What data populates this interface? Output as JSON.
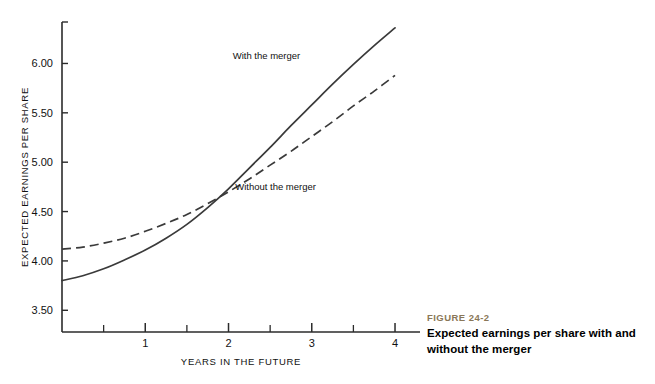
{
  "figure": {
    "kicker": "FIGURE 24-2",
    "title": "Expected earnings per share with and without the merger",
    "kicker_color": "#8a7758"
  },
  "chart_data": {
    "type": "line",
    "title": "Expected earnings per share with and without the merger",
    "xlabel": "YEARS IN THE FUTURE",
    "ylabel": "EXPECTED EARNINGS PER SHARE",
    "xlim": [
      0,
      4.3
    ],
    "ylim": [
      3.28,
      6.42
    ],
    "grid": false,
    "legend_position": "inline-annotations",
    "x_ticks_major": [
      1,
      2,
      3,
      4
    ],
    "x_tick_labels": [
      "1",
      "2",
      "3",
      "4"
    ],
    "x_ticks_minor": [
      0.5,
      1.5,
      2.5,
      3.5
    ],
    "y_ticks": [
      3.5,
      4.0,
      4.5,
      5.0,
      5.5,
      6.0
    ],
    "y_tick_labels": [
      "3.50",
      "4.00",
      "4.50",
      "5.00",
      "5.50",
      "6.00"
    ],
    "crossover": {
      "x": 1.55,
      "y": 4.52
    },
    "series": [
      {
        "name": "With the merger",
        "style": "solid",
        "color": "#3a3a3a",
        "label_x": 2.05,
        "label_y": 6.05,
        "x": [
          0,
          0.25,
          0.5,
          0.75,
          1.0,
          1.25,
          1.5,
          1.75,
          2.0,
          2.25,
          2.5,
          2.75,
          3.0,
          3.25,
          3.5,
          3.75,
          4.0
        ],
        "values": [
          3.8,
          3.85,
          3.92,
          4.01,
          4.11,
          4.23,
          4.37,
          4.54,
          4.73,
          4.94,
          5.15,
          5.37,
          5.58,
          5.79,
          5.99,
          6.18,
          6.36
        ]
      },
      {
        "name": "Without the merger",
        "style": "dashed",
        "color": "#3a3a3a",
        "label_x": 2.08,
        "label_y": 4.72,
        "x": [
          0,
          0.25,
          0.5,
          0.75,
          1.0,
          1.25,
          1.5,
          1.75,
          2.0,
          2.25,
          2.5,
          2.75,
          3.0,
          3.25,
          3.5,
          3.75,
          4.0
        ],
        "values": [
          4.12,
          4.14,
          4.18,
          4.23,
          4.3,
          4.38,
          4.47,
          4.58,
          4.7,
          4.83,
          4.97,
          5.11,
          5.26,
          5.41,
          5.57,
          5.72,
          5.88
        ]
      }
    ]
  }
}
